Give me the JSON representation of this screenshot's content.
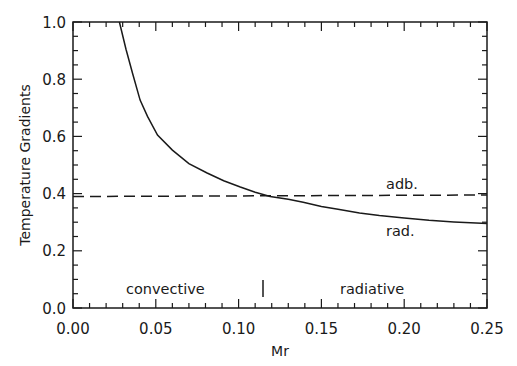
{
  "chart_data": {
    "type": "line",
    "title": "",
    "xlabel": "Mr",
    "ylabel": "Temperature Gradients",
    "xlim": [
      0.0,
      0.25
    ],
    "ylim": [
      0.0,
      1.0
    ],
    "grid": false,
    "x_ticks": [
      "0.00",
      "0.05",
      "0.10",
      "0.15",
      "0.20",
      "0.25"
    ],
    "y_ticks": [
      "0.0",
      "0.2",
      "0.4",
      "0.6",
      "0.8",
      "1.0"
    ],
    "series": [
      {
        "name": "rad.",
        "style": "solid",
        "x": [
          0.028,
          0.032,
          0.036,
          0.0405,
          0.045,
          0.051,
          0.06,
          0.07,
          0.081,
          0.091,
          0.101,
          0.11,
          0.119,
          0.13,
          0.139,
          0.15,
          0.16,
          0.173,
          0.185,
          0.2,
          0.215,
          0.23,
          0.25
        ],
        "y": [
          1.0,
          0.905,
          0.82,
          0.727,
          0.67,
          0.605,
          0.552,
          0.505,
          0.472,
          0.445,
          0.423,
          0.405,
          0.39,
          0.38,
          0.37,
          0.355,
          0.345,
          0.332,
          0.323,
          0.315,
          0.307,
          0.301,
          0.295
        ]
      },
      {
        "name": "adb.",
        "style": "dashed",
        "x": [
          0.0,
          0.25
        ],
        "y": [
          0.39,
          0.395
        ]
      }
    ],
    "annotations": [
      {
        "text": "adb.",
        "x": 0.19,
        "y": 0.43
      },
      {
        "text": "rad.",
        "x": 0.19,
        "y": 0.27
      },
      {
        "text": "convective",
        "x": 0.057,
        "y": 0.06
      },
      {
        "text": "radiative",
        "x": 0.175,
        "y": 0.06
      },
      {
        "text": "|",
        "x": 0.114,
        "y": 0.06,
        "role": "boundary marker"
      }
    ],
    "legend": "none (inline labels)"
  }
}
